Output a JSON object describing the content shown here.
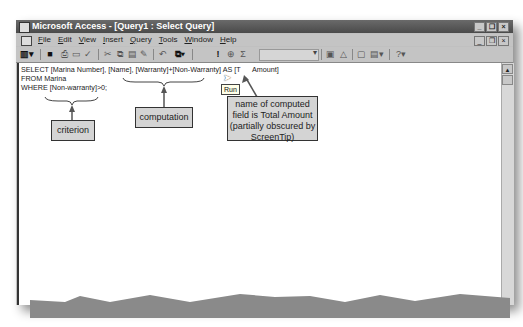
{
  "window": {
    "title": "Microsoft Access - [Query1 : Select Query]",
    "controls": [
      "minimize",
      "restore",
      "close"
    ]
  },
  "menubar": {
    "items": [
      "File",
      "Edit",
      "View",
      "Insert",
      "Query",
      "Tools",
      "Window",
      "Help"
    ]
  },
  "toolbar": {
    "buttons": [
      "view",
      "save",
      "print",
      "print-preview",
      "spelling",
      "cut",
      "copy",
      "paste",
      "format-painter",
      "undo",
      "query-type",
      "run",
      "show-table",
      "totals",
      "top-values",
      "properties",
      "build",
      "database-window",
      "new-object",
      "help"
    ],
    "combo_value": ""
  },
  "sql": {
    "line1": "SELECT [Marina Number], [Name], [Warranty]+[Non-Warranty] AS [T      Amount]",
    "line2": "FROM Marina",
    "line3": "WHERE [Non-warranty]>0;"
  },
  "tooltip": {
    "text": "Run"
  },
  "callouts": {
    "criterion": "criterion",
    "computation": "computation",
    "computed_name_1": "name of computed",
    "computed_name_2": "field is Total Amount",
    "computed_name_3": "(partially obscured by",
    "computed_name_4": "ScreenTip)"
  }
}
